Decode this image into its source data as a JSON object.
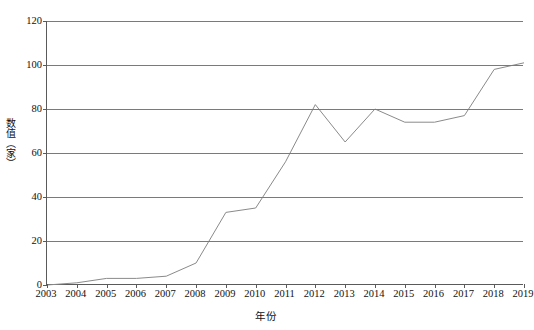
{
  "chart_data": {
    "type": "line",
    "title": "",
    "xlabel": "年份",
    "ylabel": "数值（家）",
    "x": [
      2003,
      2004,
      2005,
      2006,
      2007,
      2008,
      2009,
      2010,
      2011,
      2012,
      2013,
      2014,
      2015,
      2016,
      2017,
      2018,
      2019
    ],
    "categories": [
      "2003",
      "2004",
      "2005",
      "2006",
      "2007",
      "2008",
      "2009",
      "2010",
      "2011",
      "2012",
      "2013",
      "2014",
      "2015",
      "2016",
      "2017",
      "2018",
      "2019"
    ],
    "values": [
      0,
      1,
      3,
      3,
      4,
      10,
      33,
      35,
      56,
      82,
      65,
      80,
      74,
      74,
      77,
      98,
      101
    ],
    "series": [
      {
        "name": "数值（家）",
        "values": [
          0,
          1,
          3,
          3,
          4,
          10,
          33,
          35,
          56,
          82,
          65,
          80,
          74,
          74,
          77,
          98,
          101
        ]
      }
    ],
    "ylim": [
      0,
      120
    ],
    "yticks": [
      0,
      20,
      40,
      60,
      80,
      100,
      120
    ],
    "ytick_labels": [
      "0",
      "20",
      "40",
      "60",
      "80",
      "100",
      "120"
    ],
    "xlim": [
      2003,
      2019
    ],
    "grid": "horizontal",
    "legend": "none",
    "line_color": "#8a8a8a",
    "axis_color": "#5a5a5a",
    "grid_color": "#7a7a7a",
    "background": "#ffffff"
  }
}
